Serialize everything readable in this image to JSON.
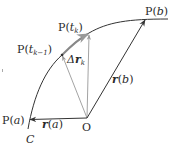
{
  "diagram": {
    "type": "vector-curve-partition",
    "curve_label": "C",
    "origin_label": "O",
    "points": {
      "start": {
        "label": "P(a)",
        "label_parts": [
          "P(",
          "a",
          ")"
        ]
      },
      "t_km1": {
        "label": "P(t_{k-1})",
        "label_parts": [
          "P(",
          "t",
          "k−1",
          ")"
        ]
      },
      "t_k": {
        "label": "P(t_k)",
        "label_parts": [
          "P(",
          "t",
          "k",
          ")"
        ]
      },
      "end": {
        "label": "P(b)",
        "label_parts": [
          "P(",
          "b",
          ")"
        ]
      }
    },
    "vectors": {
      "r_a": {
        "label": "r(a)",
        "name": "r",
        "arg": "a"
      },
      "r_b": {
        "label": "r(b)",
        "name": "r",
        "arg": "b"
      },
      "delta_r_k": {
        "label": "Δr_k",
        "delta": "Δ",
        "name": "r",
        "sub": "k"
      }
    },
    "colors": {
      "curve": "#333333",
      "main_vector": "#333333",
      "secondary_vector": "#999999",
      "chord": "#888888"
    }
  }
}
